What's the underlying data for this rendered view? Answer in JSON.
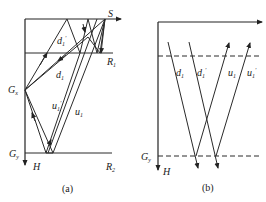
{
  "panel_a": {
    "caption": "(a)",
    "labels": {
      "source": "S",
      "reflector1": "R",
      "reflector1_sub": "1",
      "reflector2": "R",
      "reflector2_sub": "2",
      "receiver": "G",
      "receiver_sub": "x",
      "bottom_receiver": "G",
      "bottom_receiver_sub": "y",
      "depth_axis": "H",
      "down1_prime": "d",
      "down1_prime_sub": "1",
      "down1_prime_mark": "′",
      "down1": "d",
      "down1_sub": "1",
      "up1_prime": "u",
      "up1_prime_sub": "1",
      "up1_prime_mark": "′",
      "up1": "u",
      "up1_sub": "1"
    }
  },
  "panel_b": {
    "caption": "(b)",
    "labels": {
      "bottom_receiver": "G",
      "bottom_receiver_sub": "y",
      "depth_axis": "H",
      "down1": "d",
      "down1_sub": "1",
      "down1_prime": "d",
      "down1_prime_sub": "1",
      "down1_prime_mark": "′",
      "up1": "u",
      "up1_sub": "1",
      "up1_prime": "u",
      "up1_prime_sub": "1",
      "up1_prime_mark": "′"
    }
  },
  "colors": {
    "line": "#2a2a2a",
    "background": "#ffffff"
  }
}
